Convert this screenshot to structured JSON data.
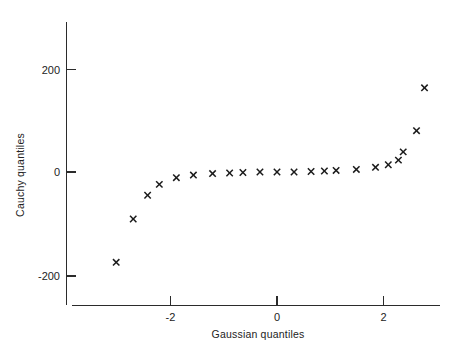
{
  "chart_data": {
    "type": "scatter",
    "title": "",
    "subtitle": "",
    "xlabel": "Gaussian quantiles",
    "ylabel": "Cauchy quantiles",
    "xlim": [
      -3.4,
      3.1
    ],
    "ylim": [
      -235,
      255
    ],
    "xticks": [
      -2,
      0,
      2
    ],
    "xticklabels": [
      "-2",
      "0",
      "2"
    ],
    "yticks": [
      200,
      0,
      -200
    ],
    "yticklabels": [
      "200",
      "0",
      "-200"
    ],
    "grid": false,
    "legend": null,
    "marker": "x",
    "marker_color": "#1b1b1b",
    "series": [
      {
        "name": "Cauchy vs Gaussian quantiles",
        "x": [
          -3.02,
          -2.7,
          -2.43,
          -2.21,
          -1.89,
          -1.57,
          -1.21,
          -0.89,
          -0.64,
          -0.32,
          0.0,
          0.32,
          0.64,
          0.89,
          1.11,
          1.49,
          1.85,
          2.09,
          2.28,
          2.37,
          2.62,
          2.77
        ],
        "y": [
          -175,
          -91,
          -45,
          -24,
          -11,
          -6,
          -3,
          -2,
          -1,
          0,
          0,
          0,
          1,
          2,
          3,
          5,
          9,
          14,
          23,
          39,
          80,
          163
        ]
      }
    ]
  },
  "axes": {
    "x_axis_name": "gaussian-quantiles-axis",
    "y_axis_name": "cauchy-quantiles-axis"
  }
}
